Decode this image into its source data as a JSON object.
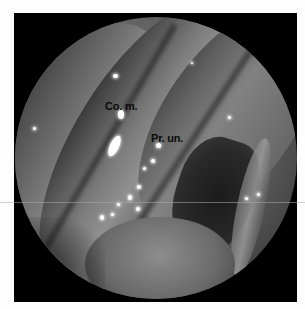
{
  "image": {
    "type": "endoscopic nasal view",
    "colors": {
      "background": "#fdfdfd",
      "frame": "#000000",
      "label_text": "#0a0a0a"
    }
  },
  "labels": [
    {
      "text": "Co. m.",
      "x": 105,
      "y": 100
    },
    {
      "text": "Pr. un.",
      "x": 151,
      "y": 132
    }
  ]
}
